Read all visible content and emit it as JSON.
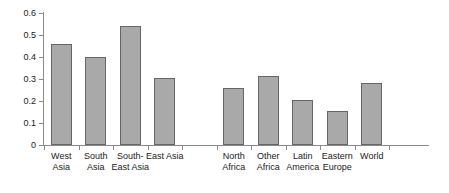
{
  "chart_data": {
    "type": "bar",
    "title": "",
    "subtitle": "",
    "xlabel": "",
    "ylabel": "",
    "ylim": [
      0,
      0.6
    ],
    "yticks": [
      "0",
      "0.1",
      "0.2",
      "0.3",
      "0.4",
      "0.5",
      "0.6"
    ],
    "ytick_values": [
      0,
      0.1,
      0.2,
      0.3,
      0.4,
      0.5,
      0.6
    ],
    "grid": false,
    "legend": "none",
    "categories": [
      "West\nAsia",
      "South\nAsia",
      "South-\nEast Asia",
      "East Asia",
      "",
      "North\nAfrica",
      "Other\nAfrica",
      "Latin\nAmerica",
      "Eastern\nEurope",
      "World"
    ],
    "category_labels": [
      "West Asia",
      "South Asia",
      "South-East Asia",
      "East Asia",
      "",
      "North Africa",
      "Other Africa",
      "Latin America",
      "Eastern Europe",
      "World"
    ],
    "values": [
      0.46,
      0.4,
      0.54,
      0.305,
      null,
      0.26,
      0.315,
      0.205,
      0.155,
      0.28
    ],
    "bar_color": "#a9a9a9",
    "bar_border_color": "#666666",
    "axis_color": "#8a8a8a",
    "text_color": "#1a1a1a",
    "background": "#ffffff"
  }
}
